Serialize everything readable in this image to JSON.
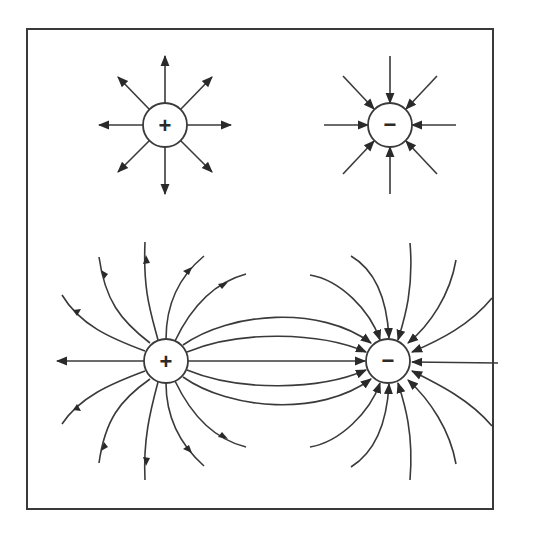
{
  "figure": {
    "panels": [
      {
        "name": "isolated-positive-charge",
        "sign": "+",
        "field_direction": "outward",
        "line_count": 8
      },
      {
        "name": "isolated-negative-charge",
        "sign": "−",
        "field_direction": "inward",
        "line_count": 8
      },
      {
        "name": "dipole",
        "charges": [
          {
            "sign": "+"
          },
          {
            "sign": "−"
          }
        ],
        "field_direction": "from + to −",
        "line_count": 16
      }
    ]
  },
  "labels": {
    "top_positive": "+",
    "top_negative": "−",
    "dipole_positive": "+",
    "dipole_negative": "−"
  },
  "colors": {
    "line": "#3a3a3a",
    "background": "#ffffff"
  }
}
